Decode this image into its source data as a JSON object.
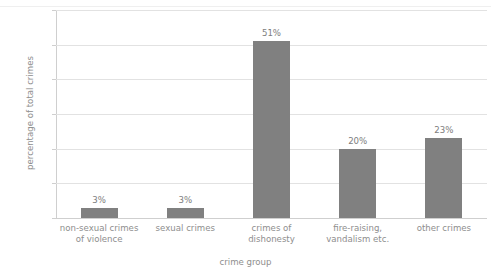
{
  "chart_data": {
    "type": "bar",
    "title": "",
    "xlabel": "crime group",
    "ylabel": "percentage of total crimes",
    "categories": [
      "non-sexual crimes of violence",
      "sexual crimes",
      "crimes of dishonesty",
      "fire-raising, vandalism etc.",
      "other crimes"
    ],
    "category_lines": [
      [
        "non-sexual crimes",
        "of violence"
      ],
      [
        "sexual crimes"
      ],
      [
        "crimes of",
        "dishonesty"
      ],
      [
        "fire-raising,",
        "vandalism etc."
      ],
      [
        "other crimes"
      ]
    ],
    "values": [
      3,
      3,
      51,
      20,
      23
    ],
    "data_labels": [
      "3%",
      "3%",
      "51%",
      "20%",
      "23%"
    ],
    "ylim": [
      0,
      60
    ],
    "yticks": [
      0,
      10,
      20,
      30,
      40,
      50,
      60
    ],
    "ytick_labels": [
      "0%",
      "10%",
      "20%",
      "30%",
      "40%",
      "50%",
      "60%"
    ],
    "grid": true,
    "legend": false,
    "bar_color": "#808080",
    "grid_color": "#e2e2e2",
    "axis_color": "#cfcfcf",
    "text_color": "#8e8e8e"
  },
  "top_strip": {
    "cut_off_title": ""
  }
}
